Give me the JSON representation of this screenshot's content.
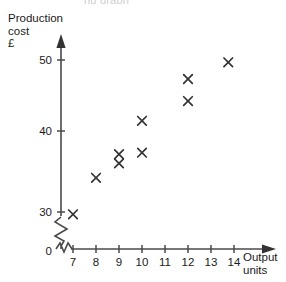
{
  "clipped_title": "ng graph",
  "axes": {
    "y_title": "Production\ncost\n£",
    "x_title": "Output\nunits",
    "origin_label": "0"
  },
  "ticks": {
    "y": [
      "50",
      "40",
      "30"
    ],
    "x": [
      "7",
      "8",
      "9",
      "10",
      "11",
      "12",
      "13",
      "14"
    ]
  },
  "chart_data": {
    "type": "scatter",
    "title": "",
    "xlabel": "Output units",
    "ylabel": "Production cost £",
    "xlim": [
      6.3,
      14.8
    ],
    "ylim": [
      28.5,
      51.5
    ],
    "grid": false,
    "legend": null,
    "axis_break": {
      "x": true,
      "y": true
    },
    "marker": "x-cross",
    "marker_color": "#333333",
    "points": [
      {
        "x": 7.0,
        "y": 29.7
      },
      {
        "x": 8.0,
        "y": 34.5
      },
      {
        "x": 9.0,
        "y": 37.6
      },
      {
        "x": 9.0,
        "y": 36.4
      },
      {
        "x": 10.0,
        "y": 42.0
      },
      {
        "x": 10.0,
        "y": 37.8
      },
      {
        "x": 12.0,
        "y": 47.5
      },
      {
        "x": 12.0,
        "y": 44.6
      },
      {
        "x": 13.75,
        "y": 49.7
      }
    ]
  }
}
